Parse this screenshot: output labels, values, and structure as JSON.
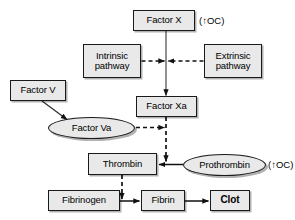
{
  "diagram": {
    "background_color": "#ffffff",
    "node_fill": "#e9e9e9",
    "node_border": "#1a1a1a",
    "nodes": [
      {
        "id": "factor_x",
        "label": "Factor X",
        "shape": "rect",
        "x": 133,
        "y": 10,
        "w": 62,
        "h": 21
      },
      {
        "id": "intrinsic",
        "label": "Intrinsic\npathway",
        "shape": "rect",
        "x": 83,
        "y": 44,
        "w": 58,
        "h": 34
      },
      {
        "id": "extrinsic",
        "label": "Extrinsic\npathway",
        "shape": "rect",
        "x": 204,
        "y": 44,
        "w": 58,
        "h": 34
      },
      {
        "id": "factor_v",
        "label": "Factor V",
        "shape": "rect",
        "x": 10,
        "y": 80,
        "w": 56,
        "h": 21
      },
      {
        "id": "factor_xa",
        "label": "Factor Xa",
        "shape": "rect",
        "x": 136,
        "y": 96,
        "w": 61,
        "h": 21
      },
      {
        "id": "factor_va",
        "label": "Factor Va",
        "shape": "ellipse",
        "x": 48,
        "y": 117,
        "w": 87,
        "h": 22
      },
      {
        "id": "thrombin",
        "label": "Thrombin",
        "shape": "rect",
        "x": 88,
        "y": 153,
        "w": 69,
        "h": 22
      },
      {
        "id": "prothrombin",
        "label": "Prothrombin",
        "shape": "ellipse",
        "x": 183,
        "y": 154,
        "w": 83,
        "h": 22
      },
      {
        "id": "fibrinogen",
        "label": "Fibrinogen",
        "shape": "rect",
        "x": 48,
        "y": 190,
        "w": 72,
        "h": 21
      },
      {
        "id": "fibrin",
        "label": "Fibrin",
        "shape": "rect",
        "x": 141,
        "y": 190,
        "w": 44,
        "h": 21
      },
      {
        "id": "clot",
        "label": "Clot",
        "shape": "rect",
        "x": 210,
        "y": 190,
        "w": 40,
        "h": 21,
        "bold": true
      }
    ],
    "annotations": [
      {
        "id": "factor_x_oc",
        "text": "(↑OC)",
        "x": 199,
        "y": 15
      },
      {
        "id": "prothrombin_oc",
        "text": "(↑OC)",
        "x": 268,
        "y": 159
      }
    ],
    "edges": [
      {
        "id": "factor_x_to_factor_xa",
        "from": "factor_x",
        "to": "factor_xa",
        "style": "solid"
      },
      {
        "id": "intrinsic_to_cascade",
        "from": "intrinsic",
        "to": "factor_x_axis",
        "style": "dashed"
      },
      {
        "id": "extrinsic_to_cascade",
        "from": "extrinsic",
        "to": "factor_x_axis",
        "style": "dashed"
      },
      {
        "id": "factor_v_to_factor_va",
        "from": "factor_v",
        "to": "factor_va",
        "style": "solid"
      },
      {
        "id": "factor_va_to_xa_axis",
        "from": "factor_va",
        "to": "factor_xa",
        "style": "dashed"
      },
      {
        "id": "factor_xa_to_thrombin_axis",
        "from": "factor_xa",
        "to": "thrombin",
        "style": "dashed"
      },
      {
        "id": "prothrombin_to_thrombin",
        "from": "prothrombin",
        "to": "thrombin",
        "style": "solid"
      },
      {
        "id": "thrombin_to_fibrin_axis",
        "from": "thrombin",
        "to": "fibrin",
        "style": "dashed"
      },
      {
        "id": "fibrinogen_to_fibrin",
        "from": "fibrinogen",
        "to": "fibrin",
        "style": "solid"
      },
      {
        "id": "fibrin_to_clot",
        "from": "fibrin",
        "to": "clot",
        "style": "solid"
      }
    ]
  }
}
